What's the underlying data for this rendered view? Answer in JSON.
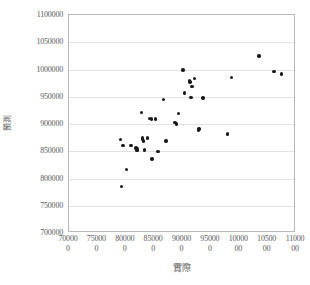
{
  "chart_data": {
    "type": "scatter",
    "title": "",
    "xlabel": "實際",
    "ylabel": "預測",
    "xlim": [
      700000,
      1100000
    ],
    "ylim": [
      700000,
      1100000
    ],
    "grid": true,
    "legend": false,
    "marker_color": "#1a1a1a",
    "x_ticks": [
      {
        "value": 700000,
        "line1": "70000",
        "line2": "0"
      },
      {
        "value": 750000,
        "line1": "75000",
        "line2": "0"
      },
      {
        "value": 800000,
        "line1": "80000",
        "line2": "0"
      },
      {
        "value": 850000,
        "line1": "85000",
        "line2": "0"
      },
      {
        "value": 900000,
        "line1": "90000",
        "line2": "0"
      },
      {
        "value": 950000,
        "line1": "95000",
        "line2": "0"
      },
      {
        "value": 1000000,
        "line1": "10000",
        "line2": "00"
      },
      {
        "value": 1050000,
        "line1": "10500",
        "line2": "00"
      },
      {
        "value": 1100000,
        "line1": "11000",
        "line2": "00"
      }
    ],
    "y_ticks": [
      {
        "value": 700000,
        "label": "700000"
      },
      {
        "value": 750000,
        "label": "750000"
      },
      {
        "value": 800000,
        "label": "800000"
      },
      {
        "value": 850000,
        "label": "850000"
      },
      {
        "value": 900000,
        "label": "900000"
      },
      {
        "value": 950000,
        "label": "950000"
      },
      {
        "value": 1000000,
        "label": "1000000"
      },
      {
        "value": 1050000,
        "label": "1050000"
      },
      {
        "value": 1100000,
        "label": "1100000"
      }
    ],
    "series": [
      {
        "name": "預測 vs 實際",
        "points": [
          [
            791000,
            872000
          ],
          [
            792000,
            785000
          ],
          [
            795000,
            861000
          ],
          [
            801000,
            817000
          ],
          [
            809000,
            861000
          ],
          [
            818000,
            856000
          ],
          [
            819000,
            853000
          ],
          [
            820000,
            851000
          ],
          [
            821000,
            854000
          ],
          [
            828000,
            921000
          ],
          [
            829000,
            874000
          ],
          [
            830000,
            872000
          ],
          [
            831000,
            869000
          ],
          [
            833000,
            852000
          ],
          [
            838000,
            874000
          ],
          [
            842000,
            910000
          ],
          [
            845000,
            909000
          ],
          [
            846000,
            836000
          ],
          [
            852000,
            909000
          ],
          [
            857000,
            849000
          ],
          [
            866000,
            945000
          ],
          [
            871000,
            869000
          ],
          [
            887000,
            903000
          ],
          [
            889000,
            900000
          ],
          [
            893000,
            919000
          ],
          [
            901000,
            999000
          ],
          [
            903000,
            957000
          ],
          [
            912000,
            980000
          ],
          [
            913000,
            977000
          ],
          [
            915000,
            949000
          ],
          [
            917000,
            969000
          ],
          [
            921000,
            983000
          ],
          [
            928000,
            889000
          ],
          [
            929000,
            891000
          ],
          [
            936000,
            948000
          ],
          [
            979000,
            882000
          ],
          [
            986000,
            985000
          ],
          [
            1035000,
            1025000
          ],
          [
            1061000,
            996000
          ],
          [
            1074000,
            992000
          ]
        ]
      }
    ]
  }
}
